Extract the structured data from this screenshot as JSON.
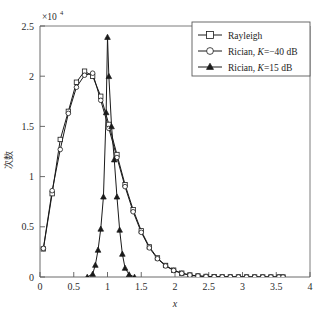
{
  "figure": {
    "background_color": "#ffffff",
    "axis_color": "#5a5a5a",
    "line_color": "#1a1a1a"
  },
  "axes": {
    "y_exponent_mantissa": "×10",
    "y_exponent_power": "4",
    "x_title": "x",
    "y_title": "次数",
    "x_ticks": [
      "0",
      "0.5",
      "1",
      "1.5",
      "2",
      "2.5",
      "3",
      "3.5",
      "4"
    ],
    "y_ticks": [
      "0",
      "0.5",
      "1",
      "1.5",
      "2",
      "2.5"
    ]
  },
  "legend": {
    "entries": [
      {
        "label": "Rayleigh",
        "marker": "square-marker"
      },
      {
        "label_prefix": "Rician, ",
        "label_italic": "K",
        "label_suffix": "=−40 dB",
        "marker": "circle-marker"
      },
      {
        "label_prefix": "Rician, ",
        "label_italic": "K",
        "label_suffix": "=15 dB",
        "marker": "triangle-marker"
      }
    ]
  },
  "chart_data": {
    "type": "line",
    "title": "",
    "xlabel": "x",
    "ylabel": "次数",
    "xlim": [
      0,
      4
    ],
    "ylim": [
      0,
      25000
    ],
    "y_scale_exponent": 4,
    "grid": false,
    "legend_position": "top-right",
    "series": [
      {
        "name": "Rayleigh",
        "marker": "square",
        "x": [
          0.05,
          0.18,
          0.3,
          0.42,
          0.54,
          0.66,
          0.78,
          0.9,
          1.02,
          1.14,
          1.26,
          1.38,
          1.5,
          1.62,
          1.74,
          1.86,
          1.98,
          2.1,
          2.22,
          2.34,
          2.46,
          2.58,
          2.7,
          2.82,
          2.94,
          3.06,
          3.18,
          3.3,
          3.42,
          3.54,
          3.6
        ],
        "y": [
          2800,
          8300,
          13700,
          16500,
          19400,
          20500,
          20000,
          18000,
          15200,
          12200,
          9200,
          6700,
          4600,
          3000,
          1900,
          1150,
          680,
          380,
          200,
          105,
          55,
          28,
          14,
          8,
          4,
          2,
          1,
          1,
          0,
          0,
          0
        ]
      },
      {
        "name": "Rician, K=−40 dB",
        "marker": "circle",
        "x": [
          0.05,
          0.18,
          0.3,
          0.42,
          0.54,
          0.66,
          0.78,
          0.9,
          1.02,
          1.14,
          1.26,
          1.38,
          1.5,
          1.62,
          1.74,
          1.86,
          1.98,
          2.1,
          2.22,
          2.34,
          2.46,
          2.58,
          2.7,
          2.82,
          2.94,
          3.06,
          3.18,
          3.3,
          3.42,
          3.54,
          3.6
        ],
        "y": [
          2850,
          8600,
          12700,
          16300,
          18900,
          20100,
          20300,
          17600,
          14800,
          11900,
          9000,
          6500,
          4450,
          2900,
          1820,
          1100,
          650,
          360,
          190,
          100,
          52,
          26,
          13,
          7,
          4,
          2,
          1,
          1,
          0,
          0,
          0
        ]
      },
      {
        "name": "Rician, K=15 dB",
        "marker": "triangle",
        "x": [
          0.7,
          0.78,
          0.82,
          0.86,
          0.9,
          0.94,
          0.98,
          1.0,
          1.02,
          1.06,
          1.1,
          1.14,
          1.18,
          1.22,
          1.26,
          1.32,
          1.4
        ],
        "y": [
          0,
          300,
          1200,
          2700,
          4800,
          8000,
          16400,
          23900,
          20000,
          15000,
          11700,
          8000,
          4700,
          2300,
          900,
          250,
          0
        ]
      }
    ]
  }
}
